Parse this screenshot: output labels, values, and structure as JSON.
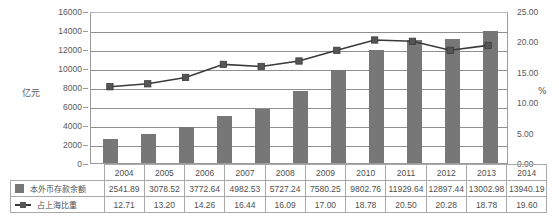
{
  "chart_data": {
    "type": "bar",
    "title": "",
    "subtitle": "",
    "xlabel": "",
    "ylabel": "亿元",
    "y2label": "%",
    "categories": [
      "2004",
      "2005",
      "2006",
      "2007",
      "2008",
      "2009",
      "2010",
      "2011",
      "2012",
      "2013",
      "2014"
    ],
    "ylim": [
      0,
      16000
    ],
    "yticks": [
      0,
      2000,
      4000,
      6000,
      8000,
      10000,
      12000,
      14000,
      16000
    ],
    "ytick_labels": [
      "0",
      "2000",
      "4000",
      "6000",
      "8000",
      "10000",
      "12000",
      "14000",
      "16000"
    ],
    "y2lim": [
      0,
      25
    ],
    "y2ticks": [
      0,
      5,
      10,
      15,
      20,
      25
    ],
    "y2tick_labels": [
      "0.00",
      "5.00",
      "10.00",
      "15.00",
      "20.00",
      "25.00"
    ],
    "grid": true,
    "legend_position": "bottom-table",
    "series": [
      {
        "name": "本外币存款余额",
        "type": "bar",
        "axis": "left",
        "color": "#777777",
        "values": [
          2541.89,
          3078.52,
          3772.64,
          4982.53,
          5727.24,
          7580.25,
          9802.76,
          11929.64,
          12897.44,
          13002.98,
          13940.19
        ],
        "value_labels": [
          "2541.89",
          "3078.52",
          "3772.64",
          "4982.53",
          "5727.24",
          "7580.25",
          "9802.76",
          "11929.64",
          "12897.44",
          "13002.98",
          "13940.19"
        ]
      },
      {
        "name": "占上海比重",
        "type": "line",
        "axis": "right",
        "color": "#3a3a3a",
        "marker": "square",
        "values": [
          12.71,
          13.2,
          14.26,
          16.44,
          16.09,
          17.0,
          18.78,
          20.5,
          20.28,
          18.78,
          19.6
        ],
        "value_labels": [
          "12.71",
          "13.20",
          "14.26",
          "16.44",
          "16.09",
          "17.00",
          "18.78",
          "20.50",
          "20.28",
          "18.78",
          "19.60"
        ]
      }
    ]
  },
  "axis": {
    "left_label": "亿元",
    "right_label": "%"
  },
  "table": {
    "years": [
      "2004",
      "2005",
      "2006",
      "2007",
      "2008",
      "2009",
      "2010",
      "2011",
      "2012",
      "2013",
      "2014"
    ],
    "rows": [
      {
        "label": "本外币存款余额",
        "marker": "bar-swatch",
        "values": [
          "2541.89",
          "3078.52",
          "3772.64",
          "4982.53",
          "5727.24",
          "7580.25",
          "9802.76",
          "11929.64",
          "12897.44",
          "13002.98",
          "13940.19"
        ]
      },
      {
        "label": "占上海比重",
        "marker": "line-swatch",
        "values": [
          "12.71",
          "13.20",
          "14.26",
          "16.44",
          "16.09",
          "17.00",
          "18.78",
          "20.50",
          "20.28",
          "18.78",
          "19.60"
        ]
      }
    ]
  },
  "colors": {
    "bar": "#777777",
    "line": "#3a3a3a",
    "marker": "#555555",
    "grid": "#8f8f8f",
    "axis": "#9a9a9a",
    "text": "#4f4f4f"
  }
}
